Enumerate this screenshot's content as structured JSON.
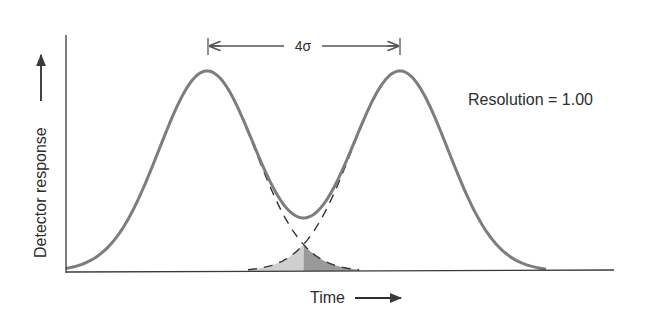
{
  "figure": {
    "annotation_width": "4σ",
    "resolution_label": "Resolution = 1.00",
    "y_axis_label": "Detector response",
    "x_axis_label": "Time"
  },
  "colors": {
    "peak_curve": "#7d7d7d",
    "axis": "#3a3a3a",
    "dashed": "#333333",
    "overlap_fill_left": "#cfcfcf",
    "overlap_fill_right": "#9a9a9a"
  },
  "chart_data": {
    "type": "line",
    "title": "Resolution = 1.00",
    "xlabel": "Time",
    "ylabel": "Detector response",
    "series": [
      {
        "name": "Peak 1 (Gaussian)",
        "center_sigma": 0,
        "height": 1.0
      },
      {
        "name": "Peak 2 (Gaussian)",
        "center_sigma": 4,
        "height": 1.0
      },
      {
        "name": "Sum (observed)",
        "valley_relative_height": 0.27
      }
    ],
    "annotations": [
      "4σ separation between peak maxima",
      "Shaded overlap region of the two peak tails"
    ],
    "grid": false
  }
}
